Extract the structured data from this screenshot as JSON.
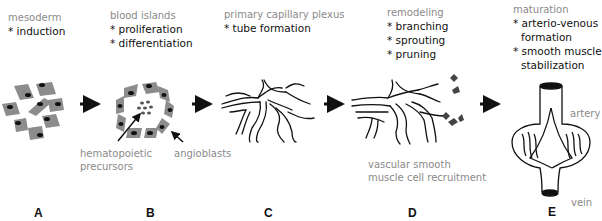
{
  "stages": [
    {
      "id": "A",
      "label": "A",
      "title": "mesoderm",
      "bullets": [
        "* induction"
      ]
    },
    {
      "id": "B",
      "label": "B",
      "title": "blood islands",
      "bullets": [
        "* proliferation",
        "* differentiation"
      ],
      "annotations": [
        "hematopoietic",
        "precursors",
        "angioblasts"
      ]
    },
    {
      "id": "C",
      "label": "C",
      "title": "primary capillary plexus",
      "bullets": [
        "* tube formation"
      ]
    },
    {
      "id": "D",
      "label": "D",
      "title": "remodeling",
      "bullets": [
        "* branching",
        "* sprouting",
        "* pruning"
      ],
      "annotations": [
        "vascular smooth",
        "muscle cell recruitment"
      ]
    },
    {
      "id": "E",
      "label": "E",
      "title": "maturation",
      "bullets": [
        "* arterio-venous",
        "formation",
        "* smooth muscle",
        "stabilization"
      ],
      "annotations": [
        "artery",
        "vein"
      ]
    }
  ],
  "colors": {
    "cell_fill": "#8c8c8c",
    "nucleus": "#111111",
    "line": "#111111",
    "label_gray": "#8a8a8a"
  }
}
